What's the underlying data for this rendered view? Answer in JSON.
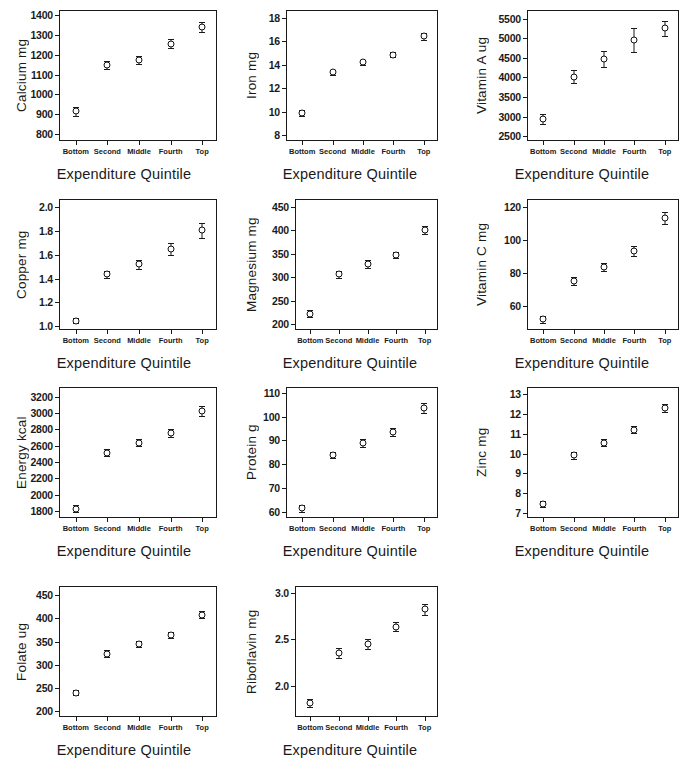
{
  "figure": {
    "xlabel": "Expenditure Quintile",
    "categories": [
      "Bottom",
      "Second",
      "Middle",
      "Fourth",
      "Top"
    ],
    "marker": "open-circle-with-error-bars",
    "ink_color": "#1a1a1a"
  },
  "chart_data": [
    {
      "type": "scatter",
      "id": "calcium",
      "title": "",
      "xlabel": "Expenditure Quintile",
      "ylabel": "Calcium mg",
      "categories": [
        "Bottom",
        "Second",
        "Middle",
        "Fourth",
        "Top"
      ],
      "values": [
        915,
        1148,
        1175,
        1255,
        1340
      ],
      "errors": [
        22,
        18,
        20,
        22,
        25
      ],
      "ylim": [
        760,
        1420
      ],
      "yticks": [
        800,
        900,
        1000,
        1100,
        1200,
        1300,
        1400
      ],
      "grid": false,
      "legend": "none"
    },
    {
      "type": "scatter",
      "id": "iron",
      "title": "",
      "xlabel": "Expenditure Quintile",
      "ylabel": "Iron mg",
      "categories": [
        "Bottom",
        "Second",
        "Middle",
        "Fourth",
        "Top"
      ],
      "values": [
        9.85,
        13.35,
        14.2,
        14.85,
        16.45
      ],
      "errors": [
        0.25,
        0.2,
        0.2,
        0.22,
        0.3
      ],
      "ylim": [
        7.4,
        18.6
      ],
      "yticks": [
        8,
        10,
        12,
        14,
        16,
        18
      ],
      "grid": false,
      "legend": "none"
    },
    {
      "type": "scatter",
      "id": "vitamin-a",
      "title": "",
      "xlabel": "Expenditure Quintile",
      "ylabel": "Vitamin A ug",
      "categories": [
        "Bottom",
        "Second",
        "Middle",
        "Fourth",
        "Top"
      ],
      "values": [
        2940,
        4020,
        4470,
        4960,
        5260
      ],
      "errors": [
        130,
        160,
        200,
        300,
        190
      ],
      "ylim": [
        2350,
        5700
      ],
      "yticks": [
        2500,
        3000,
        3500,
        4000,
        4500,
        5000,
        5500
      ],
      "grid": false,
      "legend": "none"
    },
    {
      "type": "scatter",
      "id": "copper",
      "title": "",
      "xlabel": "Expenditure Quintile",
      "ylabel": "Copper mg",
      "categories": [
        "Bottom",
        "Second",
        "Middle",
        "Fourth",
        "Top"
      ],
      "values": [
        1.045,
        1.435,
        1.52,
        1.65,
        1.805
      ],
      "errors": [
        0.02,
        0.03,
        0.04,
        0.05,
        0.06
      ],
      "ylim": [
        0.96,
        2.06
      ],
      "yticks": [
        1.0,
        1.2,
        1.4,
        1.6,
        1.8,
        2.0
      ],
      "ytick_labels": [
        "1.0",
        "1.2",
        "1.4",
        "1.6",
        "1.8",
        "2.0"
      ],
      "grid": false,
      "legend": "none"
    },
    {
      "type": "scatter",
      "id": "magnesium",
      "title": "",
      "xlabel": "Expenditure Quintile",
      "ylabel": "Magnesium mg",
      "categories": [
        "Bottom",
        "Second",
        "Middle",
        "Fourth",
        "Top"
      ],
      "values": [
        222,
        306,
        328,
        347,
        401
      ],
      "errors": [
        7,
        7,
        8,
        7,
        9
      ],
      "ylim": [
        185,
        465
      ],
      "yticks": [
        200,
        250,
        300,
        350,
        400,
        450
      ],
      "grid": false,
      "legend": "none"
    },
    {
      "type": "scatter",
      "id": "vitamin-c",
      "title": "",
      "xlabel": "Expenditure Quintile",
      "ylabel": "Vitamin C mg",
      "categories": [
        "Bottom",
        "Second",
        "Middle",
        "Fourth",
        "Top"
      ],
      "values": [
        52,
        75,
        83.5,
        93.5,
        113
      ],
      "errors": [
        2,
        2.5,
        2.5,
        3,
        3.5
      ],
      "ylim": [
        45,
        124
      ],
      "yticks": [
        60,
        80,
        100,
        120
      ],
      "grid": false,
      "legend": "none"
    },
    {
      "type": "scatter",
      "id": "energy",
      "title": "",
      "xlabel": "Expenditure Quintile",
      "ylabel": "Energy kcal",
      "categories": [
        "Bottom",
        "Second",
        "Middle",
        "Fourth",
        "Top"
      ],
      "values": [
        1825,
        2515,
        2640,
        2755,
        3025
      ],
      "errors": [
        45,
        45,
        45,
        45,
        60
      ],
      "ylim": [
        1700,
        3310
      ],
      "yticks": [
        1800,
        2000,
        2200,
        2400,
        2600,
        2800,
        3000,
        3200
      ],
      "grid": false,
      "legend": "none"
    },
    {
      "type": "scatter",
      "id": "protein",
      "title": "",
      "xlabel": "Expenditure Quintile",
      "ylabel": "Protein g",
      "categories": [
        "Bottom",
        "Second",
        "Middle",
        "Fourth",
        "Top"
      ],
      "values": [
        61.5,
        84,
        89,
        93.5,
        103.5
      ],
      "errors": [
        1.5,
        1.3,
        1.6,
        1.6,
        2
      ],
      "ylim": [
        57,
        112
      ],
      "yticks": [
        60,
        70,
        80,
        90,
        100,
        110
      ],
      "grid": false,
      "legend": "none"
    },
    {
      "type": "scatter",
      "id": "zinc",
      "title": "",
      "xlabel": "Expenditure Quintile",
      "ylabel": "Zinc mg",
      "categories": [
        "Bottom",
        "Second",
        "Middle",
        "Fourth",
        "Top"
      ],
      "values": [
        7.45,
        9.9,
        10.55,
        11.2,
        12.3
      ],
      "errors": [
        0.15,
        0.17,
        0.17,
        0.17,
        0.2
      ],
      "ylim": [
        6.7,
        13.3
      ],
      "yticks": [
        7,
        8,
        9,
        10,
        11,
        12,
        13
      ],
      "grid": false,
      "legend": "none"
    },
    {
      "type": "scatter",
      "id": "folate",
      "title": "",
      "xlabel": "Expenditure Quintile",
      "ylabel": "Folate ug",
      "categories": [
        "Bottom",
        "Second",
        "Middle",
        "Fourth",
        "Top"
      ],
      "values": [
        240,
        324,
        345,
        364,
        408
      ],
      "errors": [
        6,
        7,
        7,
        7,
        8
      ],
      "ylim": [
        185,
        468
      ],
      "yticks": [
        200,
        250,
        300,
        350,
        400,
        450
      ],
      "grid": false,
      "legend": "none"
    },
    {
      "type": "scatter",
      "id": "riboflavin",
      "title": "",
      "xlabel": "Expenditure Quintile",
      "ylabel": "Riboflavin mg",
      "categories": [
        "Bottom",
        "Second",
        "Middle",
        "Fourth",
        "Top"
      ],
      "values": [
        1.82,
        2.355,
        2.45,
        2.635,
        2.82
      ],
      "errors": [
        0.045,
        0.05,
        0.05,
        0.05,
        0.06
      ],
      "ylim": [
        1.66,
        3.06
      ],
      "yticks": [
        2.0,
        2.5,
        3.0
      ],
      "ytick_labels": [
        "2.0",
        "2.5",
        "3.0"
      ],
      "grid": false,
      "legend": "none"
    }
  ]
}
